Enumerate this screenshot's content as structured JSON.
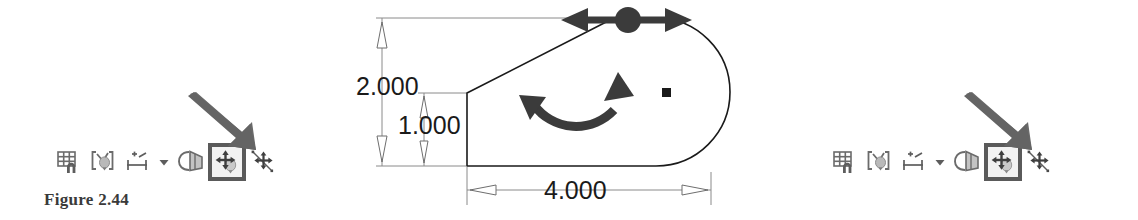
{
  "figure": {
    "caption": "Figure 2.44"
  },
  "drawing": {
    "type": "cad-sketch",
    "title": "Slot / D-shaped profile sketch with drag and rotate handles",
    "dimensions": [
      {
        "name": "overall-height",
        "value": "2.000",
        "orientation": "vertical"
      },
      {
        "name": "left-edge-height",
        "value": "1.000",
        "orientation": "vertical"
      },
      {
        "name": "overall-length",
        "value": "4.000",
        "orientation": "horizontal"
      }
    ],
    "handles": [
      {
        "name": "translate-handle",
        "kind": "double-arrow-horizontal-with-node"
      },
      {
        "name": "rotate-handle",
        "kind": "curved-double-arrow"
      },
      {
        "name": "center-point-marker",
        "kind": "filled-square"
      }
    ],
    "line_color": "#1a1a1a",
    "dimension_color": "#777777",
    "handle_color": "#3b3b3b"
  },
  "toolbars": {
    "pointer_color": "#5f5f5f",
    "highlight_border_color": "#5a5a5a",
    "left": {
      "name": "sketch-toolbar-left",
      "items": [
        {
          "name": "grid-snap-icon",
          "label": "Grid Snap",
          "selected": false
        },
        {
          "name": "constraints-icon",
          "label": "Show Constraints",
          "selected": false
        },
        {
          "name": "dimension-icon",
          "label": "Dimension",
          "selected": false
        },
        {
          "name": "chevron-down-icon",
          "label": "More",
          "selected": false
        },
        {
          "name": "mirror-offset-icon",
          "label": "Offset",
          "selected": false
        },
        {
          "name": "move-entities-icon",
          "label": "Move Entities",
          "selected": true
        },
        {
          "name": "move-point-icon",
          "label": "Move Point",
          "selected": false
        }
      ]
    },
    "right": {
      "name": "sketch-toolbar-right",
      "items": [
        {
          "name": "grid-snap-icon",
          "label": "Grid Snap",
          "selected": false
        },
        {
          "name": "constraints-icon",
          "label": "Show Constraints",
          "selected": false
        },
        {
          "name": "dimension-icon",
          "label": "Dimension",
          "selected": false
        },
        {
          "name": "chevron-down-icon",
          "label": "More",
          "selected": false
        },
        {
          "name": "mirror-offset-icon",
          "label": "Offset",
          "selected": false
        },
        {
          "name": "move-entities-icon",
          "label": "Move Entities",
          "selected": true
        },
        {
          "name": "move-point-icon",
          "label": "Move Point",
          "selected": false
        }
      ]
    }
  }
}
